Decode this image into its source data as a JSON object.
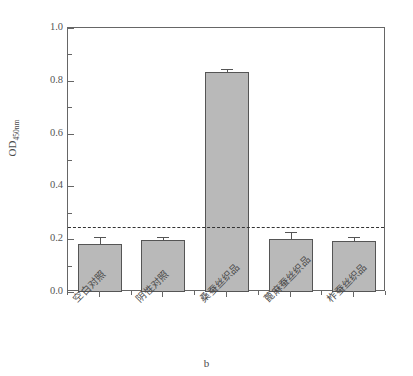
{
  "figure": {
    "panel_label": "b"
  },
  "chart_data": {
    "type": "bar",
    "title": "",
    "subtitle": "",
    "xlabel": "",
    "ylabel": "OD",
    "ylabel_subscript": "450nm",
    "categories": [
      "空白对照",
      "阴性对照",
      "桑蚕丝织品",
      "蓖麻蚕丝织品",
      "柞蚕丝织品"
    ],
    "values": [
      0.182,
      0.196,
      0.834,
      0.199,
      0.194
    ],
    "errors": [
      0.025,
      0.013,
      0.01,
      0.028,
      0.016
    ],
    "ylim": [
      0.0,
      1.0
    ],
    "ytick_labels": [
      "0.0",
      "0.2",
      "0.4",
      "0.6",
      "0.8",
      "1.0"
    ],
    "ytick_values": [
      0.0,
      0.2,
      0.4,
      0.6,
      0.8,
      1.0
    ],
    "yminor_values": [
      0.1,
      0.3,
      0.5,
      0.7,
      0.9
    ],
    "grid": false,
    "legend": false,
    "legend_position": "none",
    "annotations": [
      {
        "name": "cutoff-line",
        "type": "hline",
        "value": 0.245,
        "style": "dashed"
      }
    ],
    "bar_color": "#b9b9b9",
    "bar_edge_color": "#555555",
    "axis_color": "#666666",
    "cutoff_color": "#333333"
  }
}
